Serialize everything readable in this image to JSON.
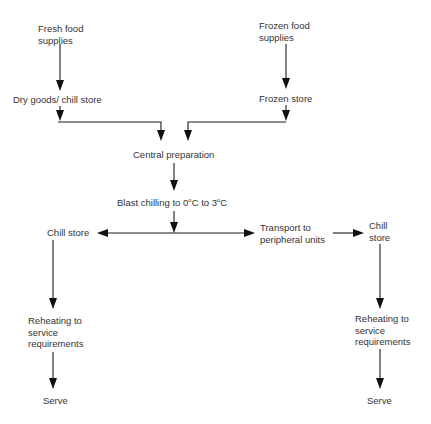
{
  "diagram": {
    "type": "flowchart",
    "nodes": {
      "fresh_food": {
        "line1": "Fresh food",
        "line2": "supplies"
      },
      "frozen_food": {
        "line1": "Frozen food",
        "line2": "supplies"
      },
      "dry_goods": {
        "label": "Dry goods/ chill store"
      },
      "frozen_store": {
        "label": "Frozen store"
      },
      "central_prep": {
        "label": "Central preparation"
      },
      "blast_chilling": {
        "prefix": "Blast chilling to 0",
        "deg1": "o",
        "mid": "C to 3",
        "deg2": "o",
        "suffix": "C"
      },
      "chill_store_left": {
        "label": "Chill store"
      },
      "transport": {
        "line1": "Transport to",
        "line2": "peripheral units"
      },
      "chill_store_right": {
        "line1": "Chill",
        "line2": "store"
      },
      "reheat_left": {
        "line1": "Reheating to",
        "line2": "service",
        "line3": "requirements"
      },
      "reheat_right": {
        "line1": "Reheating to",
        "line2": "service",
        "line3": "requirements"
      },
      "serve_left": {
        "label": "Serve"
      },
      "serve_right": {
        "label": "Serve"
      }
    },
    "edges": [
      [
        "Fresh food supplies",
        "Dry goods/ chill store"
      ],
      [
        "Frozen food supplies",
        "Frozen store"
      ],
      [
        "Dry goods/ chill store",
        "Central preparation"
      ],
      [
        "Frozen store",
        "Central preparation"
      ],
      [
        "Central preparation",
        "Blast chilling to 0°C to 3°C"
      ],
      [
        "Blast chilling to 0°C to 3°C",
        "Chill store"
      ],
      [
        "Blast chilling to 0°C to 3°C",
        "Transport to peripheral units"
      ],
      [
        "Transport to peripheral units",
        "Chill store (peripheral)"
      ],
      [
        "Chill store",
        "Reheating to service requirements"
      ],
      [
        "Reheating to service requirements",
        "Serve"
      ],
      [
        "Chill store (peripheral)",
        "Reheating to service requirements (peripheral)"
      ],
      [
        "Reheating to service requirements (peripheral)",
        "Serve (peripheral)"
      ]
    ]
  }
}
